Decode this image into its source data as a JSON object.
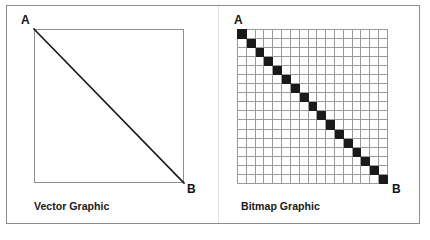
{
  "figure": {
    "background_color": "#ffffff",
    "frame_color": "#8c8c8c",
    "ink_color": "#1a1a1a",
    "grid_line_color": "#9a9a9a"
  },
  "panels": [
    {
      "id": "vector",
      "caption": "Vector Graphic",
      "start_label": "A",
      "end_label": "B",
      "shape": "square-with-diagonal",
      "line": {
        "from": [
          0,
          0
        ],
        "to": [
          150,
          154
        ],
        "stroke_width": 1.6
      }
    },
    {
      "id": "bitmap",
      "caption": "Bitmap Graphic",
      "start_label": "A",
      "end_label": "B",
      "shape": "pixel-grid-with-stair-diagonal"
    }
  ],
  "chart_data": {
    "type": "heatmap",
    "xlabel": "",
    "ylabel": "",
    "grid": true,
    "legend": "none",
    "columns": 17,
    "rows": 17,
    "on_color": "#1a1a1a",
    "off_color": "#ffffff",
    "annotations": [
      "A",
      "B"
    ],
    "values": [
      [
        1,
        0,
        0,
        0,
        0,
        0,
        0,
        0,
        0,
        0,
        0,
        0,
        0,
        0,
        0,
        0,
        0
      ],
      [
        0,
        1,
        0,
        0,
        0,
        0,
        0,
        0,
        0,
        0,
        0,
        0,
        0,
        0,
        0,
        0,
        0
      ],
      [
        0,
        0,
        1,
        0,
        0,
        0,
        0,
        0,
        0,
        0,
        0,
        0,
        0,
        0,
        0,
        0,
        0
      ],
      [
        0,
        0,
        0,
        1,
        0,
        0,
        0,
        0,
        0,
        0,
        0,
        0,
        0,
        0,
        0,
        0,
        0
      ],
      [
        0,
        0,
        0,
        0,
        1,
        0,
        0,
        0,
        0,
        0,
        0,
        0,
        0,
        0,
        0,
        0,
        0
      ],
      [
        0,
        0,
        0,
        0,
        0,
        1,
        0,
        0,
        0,
        0,
        0,
        0,
        0,
        0,
        0,
        0,
        0
      ],
      [
        0,
        0,
        0,
        0,
        0,
        0,
        1,
        0,
        0,
        0,
        0,
        0,
        0,
        0,
        0,
        0,
        0
      ],
      [
        0,
        0,
        0,
        0,
        0,
        0,
        0,
        1,
        0,
        0,
        0,
        0,
        0,
        0,
        0,
        0,
        0
      ],
      [
        0,
        0,
        0,
        0,
        0,
        0,
        0,
        0,
        1,
        0,
        0,
        0,
        0,
        0,
        0,
        0,
        0
      ],
      [
        0,
        0,
        0,
        0,
        0,
        0,
        0,
        0,
        0,
        1,
        0,
        0,
        0,
        0,
        0,
        0,
        0
      ],
      [
        0,
        0,
        0,
        0,
        0,
        0,
        0,
        0,
        0,
        0,
        1,
        0,
        0,
        0,
        0,
        0,
        0
      ],
      [
        0,
        0,
        0,
        0,
        0,
        0,
        0,
        0,
        0,
        0,
        0,
        1,
        0,
        0,
        0,
        0,
        0
      ],
      [
        0,
        0,
        0,
        0,
        0,
        0,
        0,
        0,
        0,
        0,
        0,
        0,
        1,
        0,
        0,
        0,
        0
      ],
      [
        0,
        0,
        0,
        0,
        0,
        0,
        0,
        0,
        0,
        0,
        0,
        0,
        0,
        1,
        0,
        0,
        0
      ],
      [
        0,
        0,
        0,
        0,
        0,
        0,
        0,
        0,
        0,
        0,
        0,
        0,
        0,
        0,
        1,
        0,
        0
      ],
      [
        0,
        0,
        0,
        0,
        0,
        0,
        0,
        0,
        0,
        0,
        0,
        0,
        0,
        0,
        0,
        1,
        0
      ],
      [
        0,
        0,
        0,
        0,
        0,
        0,
        0,
        0,
        0,
        0,
        0,
        0,
        0,
        0,
        0,
        0,
        1
      ]
    ]
  }
}
